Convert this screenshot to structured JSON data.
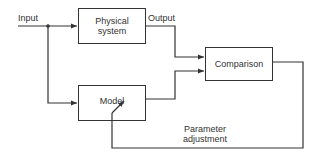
{
  "diagram": {
    "labels": {
      "input": "Input",
      "output": "Output",
      "parameter_adjustment_line1": "Parameter",
      "parameter_adjustment_line2": "adjustment"
    },
    "blocks": {
      "physical_system_line1": "Physical",
      "physical_system_line2": "system",
      "model": "Model",
      "comparison": "Comparison"
    },
    "stroke_color": "#333333"
  }
}
